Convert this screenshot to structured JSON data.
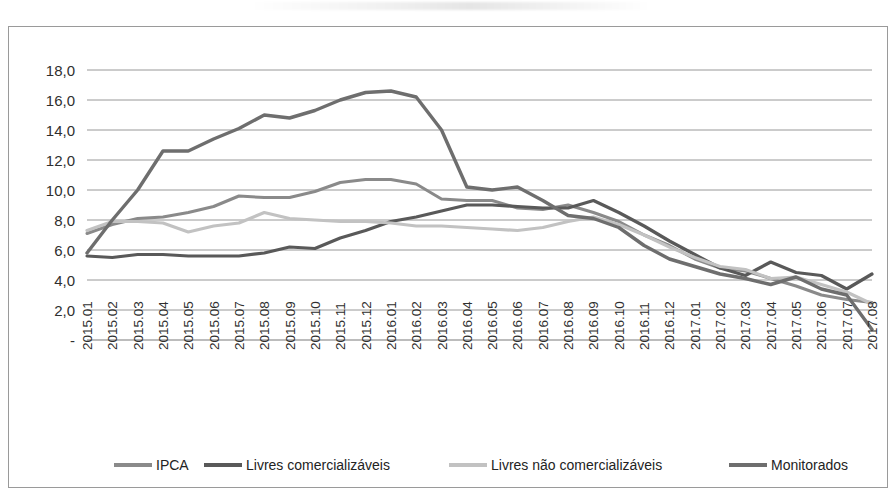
{
  "chart_data": {
    "type": "line",
    "title": "",
    "subtitle": "",
    "xlabel": "",
    "ylabel": "",
    "ylim": [
      0,
      19
    ],
    "y_ticks": [
      "-",
      "2,0",
      "4,0",
      "6,0",
      "8,0",
      "10,0",
      "12,0",
      "14,0",
      "16,0",
      "18,0"
    ],
    "y_tick_values": [
      0,
      2,
      4,
      6,
      8,
      10,
      12,
      14,
      16,
      18
    ],
    "grid": "horizontal",
    "legend_position": "bottom",
    "decimal_separator": ",",
    "categories": [
      "2015.01",
      "2015.02",
      "2015.03",
      "2015.04",
      "2015.05",
      "2015.06",
      "2015.07",
      "2015.08",
      "2015.09",
      "2015.10",
      "2015.11",
      "2015.12",
      "2016.01",
      "2016.02",
      "2016.03",
      "2016.04",
      "2016.05",
      "2016.06",
      "2016.07",
      "2016.08",
      "2016.09",
      "2016.10",
      "2016.11",
      "2016.12",
      "2017.01",
      "2017.02",
      "2017.03",
      "2017.04",
      "2017.05",
      "2017.06",
      "2017.07",
      "2017.08"
    ],
    "series": [
      {
        "name": "IPCA",
        "color": "#8a8a8a",
        "width": 3.0,
        "values": [
          7.1,
          7.7,
          8.1,
          8.2,
          8.5,
          8.9,
          9.6,
          9.5,
          9.5,
          9.9,
          10.5,
          10.7,
          10.7,
          10.4,
          9.4,
          9.3,
          9.3,
          8.8,
          8.7,
          9.0,
          8.5,
          7.9,
          7.0,
          6.3,
          5.4,
          4.8,
          4.6,
          4.1,
          3.6,
          3.0,
          2.7,
          2.5
        ],
        "note": "overall index"
      },
      {
        "name": "Livres comercializáveis",
        "color": "#595959",
        "width": 3.2,
        "values": [
          5.6,
          5.5,
          5.7,
          5.7,
          5.6,
          5.6,
          5.6,
          5.8,
          6.2,
          6.1,
          6.8,
          7.3,
          7.9,
          8.2,
          8.6,
          9.0,
          9.0,
          8.9,
          8.8,
          8.8,
          9.3,
          8.5,
          7.6,
          6.6,
          5.7,
          4.8,
          4.3,
          5.2,
          4.5,
          4.3,
          3.4,
          4.4
        ],
        "note": "tradable free prices"
      },
      {
        "name": "Livres não comercializáveis",
        "color": "#c2c2c2",
        "width": 3.2,
        "values": [
          7.3,
          7.9,
          7.9,
          7.8,
          7.2,
          7.6,
          7.8,
          8.5,
          8.1,
          8.0,
          7.9,
          7.9,
          7.8,
          7.6,
          7.6,
          7.5,
          7.4,
          7.3,
          7.5,
          7.9,
          8.2,
          7.7,
          7.0,
          6.2,
          5.5,
          4.9,
          4.7,
          4.1,
          4.2,
          3.7,
          3.2,
          2.4
        ],
        "note": "non-tradable free prices"
      },
      {
        "name": "Monitorados",
        "color": "#6e6e6e",
        "width": 3.4,
        "values": [
          5.8,
          8.0,
          10.0,
          12.6,
          12.6,
          13.4,
          14.1,
          15.0,
          14.8,
          15.3,
          16.0,
          16.5,
          16.6,
          16.2,
          14.0,
          10.2,
          10.0,
          10.2,
          9.3,
          8.3,
          8.1,
          7.5,
          6.3,
          5.4,
          4.9,
          4.4,
          4.1,
          3.7,
          4.2,
          3.4,
          3.0,
          0.7
        ],
        "note": "administered prices"
      }
    ]
  },
  "legend": {
    "items": [
      {
        "label": "IPCA",
        "color": "#8a8a8a"
      },
      {
        "label": "Livres comercializáveis",
        "color": "#595959"
      },
      {
        "label": "Livres não comercializáveis",
        "color": "#c2c2c2"
      },
      {
        "label": "Monitorados",
        "color": "#6e6e6e"
      }
    ]
  },
  "colors": {
    "grid": "#8d8d8d",
    "border": "#9a9a9a",
    "text": "#2f2f2f",
    "background": "#ffffff"
  }
}
